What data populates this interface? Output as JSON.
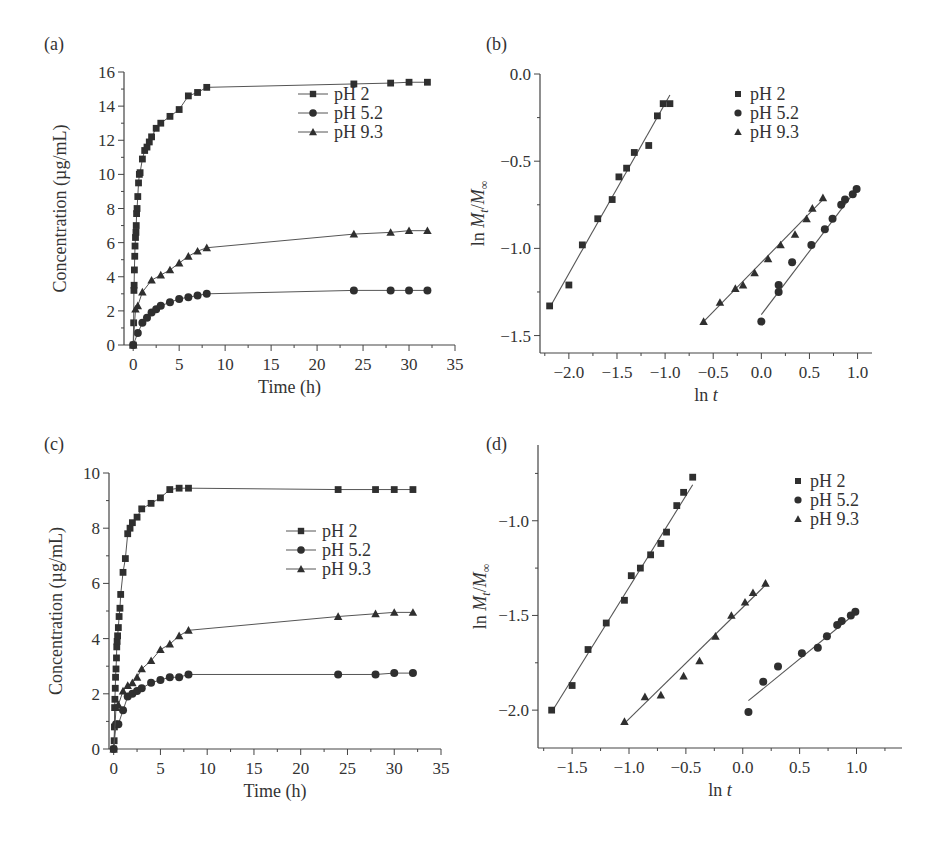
{
  "chart_data": [
    {
      "id": "a",
      "panel_label": "(a)",
      "type": "line",
      "xlabel": "Time (h)",
      "ylabel": "Concentration (µg/mL)",
      "xlim": [
        -1,
        35
      ],
      "ylim": [
        0,
        16
      ],
      "xticks": [
        0,
        5,
        10,
        15,
        20,
        25,
        30,
        35
      ],
      "yticks": [
        0,
        2,
        4,
        6,
        8,
        10,
        12,
        14,
        16
      ],
      "ytick_decimals": 0,
      "xtick_decimals": 0,
      "legend": "center-right",
      "legend_style": "line-marker",
      "series": [
        {
          "name": "pH 2",
          "marker": "square",
          "x": [
            0,
            0.05,
            0.08,
            0.1,
            0.13,
            0.17,
            0.2,
            0.25,
            0.3,
            0.33,
            0.37,
            0.42,
            0.5,
            0.58,
            0.67,
            0.75,
            1,
            1.25,
            1.5,
            1.75,
            2,
            2.5,
            3,
            4,
            5,
            6,
            7,
            8,
            24,
            28,
            30,
            32
          ],
          "y": [
            0,
            1.3,
            3.2,
            3.5,
            4.4,
            5.2,
            5.8,
            6.3,
            6.6,
            7.0,
            7.7,
            8.0,
            8.7,
            9.5,
            10.0,
            10.1,
            10.9,
            11.4,
            11.6,
            11.9,
            12.2,
            12.7,
            13.0,
            13.4,
            13.8,
            14.6,
            14.8,
            15.1,
            15.3,
            15.35,
            15.4,
            15.4
          ],
          "note": "pH 2 curve"
        },
        {
          "name": "pH 5.2",
          "marker": "circle",
          "x": [
            0,
            0.5,
            1,
            1.5,
            2,
            2.5,
            3,
            4,
            5,
            6,
            7,
            8,
            24,
            28,
            30,
            32
          ],
          "y": [
            0,
            0.7,
            1.3,
            1.6,
            1.9,
            2.1,
            2.3,
            2.5,
            2.7,
            2.8,
            2.9,
            3.0,
            3.2,
            3.2,
            3.2,
            3.2
          ]
        },
        {
          "name": "pH 9.3",
          "marker": "triangle",
          "x": [
            0,
            0.25,
            0.5,
            1,
            2,
            3,
            4,
            5,
            6,
            7,
            8,
            24,
            28,
            30,
            32
          ],
          "y": [
            0,
            2.1,
            2.3,
            3.1,
            3.8,
            4.1,
            4.4,
            4.8,
            5.2,
            5.5,
            5.7,
            6.5,
            6.6,
            6.7,
            6.7
          ]
        }
      ]
    },
    {
      "id": "b",
      "panel_label": "(b)",
      "type": "scatter",
      "xlabel": "ln t",
      "ylabel": "ln Mt/M∞",
      "xlim": [
        -2.3,
        1.15
      ],
      "ylim": [
        -1.6,
        0.0
      ],
      "xticks": [
        -2.0,
        -1.5,
        -1.0,
        -0.5,
        0.0,
        0.5,
        1.0
      ],
      "yticks": [
        0.0,
        -0.5,
        -1.0,
        -1.5
      ],
      "ytick_decimals": 1,
      "xtick_decimals": 1,
      "legend": "top-right",
      "legend_style": "marker-only",
      "series": [
        {
          "name": "pH 2",
          "marker": "square",
          "x": [
            -2.2,
            -2.0,
            -1.86,
            -1.7,
            -1.55,
            -1.48,
            -1.4,
            -1.32,
            -1.17,
            -1.08,
            -1.02,
            -0.95
          ],
          "y": [
            -1.33,
            -1.21,
            -0.98,
            -0.83,
            -0.72,
            -0.59,
            -0.54,
            -0.45,
            -0.41,
            -0.24,
            -0.17,
            -0.17
          ],
          "fit": {
            "x": [
              -2.2,
              -0.95
            ],
            "y": [
              -1.34,
              -0.12
            ]
          }
        },
        {
          "name": "pH 5.2",
          "marker": "circle",
          "x": [
            0.0,
            0.18,
            0.18,
            0.32,
            0.52,
            0.66,
            0.74,
            0.83,
            0.87,
            0.95,
            0.99
          ],
          "y": [
            -1.42,
            -1.25,
            -1.21,
            -1.08,
            -0.98,
            -0.89,
            -0.83,
            -0.75,
            -0.72,
            -0.69,
            -0.66
          ],
          "fit": {
            "x": [
              0.0,
              0.99
            ],
            "y": [
              -1.38,
              -0.66
            ]
          }
        },
        {
          "name": "pH 9.3",
          "marker": "triangle",
          "x": [
            -0.6,
            -0.43,
            -0.27,
            -0.19,
            -0.07,
            0.07,
            0.2,
            0.35,
            0.47,
            0.53,
            0.64
          ],
          "y": [
            -1.42,
            -1.31,
            -1.23,
            -1.21,
            -1.14,
            -1.06,
            -0.98,
            -0.92,
            -0.83,
            -0.77,
            -0.71
          ],
          "fit": {
            "x": [
              -0.6,
              0.64
            ],
            "y": [
              -1.42,
              -0.72
            ]
          }
        }
      ]
    },
    {
      "id": "c",
      "panel_label": "(c)",
      "type": "line",
      "xlabel": "Time (h)",
      "ylabel": "Concentration (µg/mL)",
      "xlim": [
        -0.5,
        35
      ],
      "ylim": [
        0,
        10
      ],
      "xticks": [
        0,
        5,
        10,
        15,
        20,
        25,
        30,
        35
      ],
      "yticks": [
        0,
        2,
        4,
        6,
        8,
        10
      ],
      "ytick_decimals": 0,
      "xtick_decimals": 0,
      "legend": "center-right",
      "legend_style": "line-marker",
      "series": [
        {
          "name": "pH 2",
          "marker": "square",
          "x": [
            0,
            0.05,
            0.08,
            0.1,
            0.13,
            0.17,
            0.2,
            0.25,
            0.3,
            0.33,
            0.37,
            0.42,
            0.5,
            0.58,
            0.67,
            0.75,
            1,
            1.25,
            1.5,
            1.75,
            2,
            2.5,
            3,
            4,
            5,
            6,
            7,
            8,
            24,
            28,
            30,
            32
          ],
          "y": [
            0,
            0.3,
            0.8,
            1.5,
            1.8,
            2.2,
            2.6,
            2.9,
            3.3,
            3.7,
            3.9,
            4.1,
            4.4,
            4.8,
            5.1,
            5.6,
            6.4,
            6.9,
            7.8,
            8.0,
            8.2,
            8.4,
            8.7,
            8.9,
            9.1,
            9.4,
            9.45,
            9.45,
            9.4,
            9.4,
            9.4,
            9.4
          ]
        },
        {
          "name": "pH 5.2",
          "marker": "circle",
          "x": [
            0,
            0.25,
            0.5,
            1,
            1.5,
            2,
            2.5,
            3,
            4,
            5,
            6,
            7,
            8,
            24,
            28,
            30,
            32
          ],
          "y": [
            0,
            0.9,
            0.9,
            1.4,
            1.9,
            2.0,
            2.1,
            2.2,
            2.4,
            2.5,
            2.6,
            2.6,
            2.7,
            2.7,
            2.7,
            2.75,
            2.75
          ]
        },
        {
          "name": "pH 9.3",
          "marker": "triangle",
          "x": [
            0,
            0.25,
            0.5,
            1,
            1.5,
            2,
            2.5,
            3,
            4,
            5,
            6,
            7,
            8,
            24,
            28,
            30,
            32
          ],
          "y": [
            0,
            1.5,
            1.6,
            2.1,
            2.3,
            2.4,
            2.6,
            2.9,
            3.2,
            3.6,
            3.8,
            4.1,
            4.3,
            4.8,
            4.9,
            4.95,
            4.95
          ]
        }
      ]
    },
    {
      "id": "d",
      "panel_label": "(d)",
      "type": "scatter",
      "xlabel": "ln t",
      "ylabel": "ln Mt/M∞",
      "xlim": [
        -1.8,
        1.4
      ],
      "ylim": [
        -2.2,
        -0.6
      ],
      "xticks": [
        -1.5,
        -1.0,
        -0.5,
        0.0,
        0.5,
        1.0
      ],
      "yticks": [
        -1.0,
        -1.5,
        -2.0
      ],
      "ytick_decimals": 1,
      "xtick_decimals": 1,
      "legend": "top-right",
      "legend_style": "marker-only",
      "series": [
        {
          "name": "pH 2",
          "marker": "square",
          "x": [
            -1.68,
            -1.5,
            -1.36,
            -1.2,
            -1.04,
            -0.98,
            -0.9,
            -0.81,
            -0.72,
            -0.67,
            -0.58,
            -0.52,
            -0.44
          ],
          "y": [
            -2.0,
            -1.87,
            -1.68,
            -1.54,
            -1.42,
            -1.29,
            -1.25,
            -1.18,
            -1.12,
            -1.06,
            -0.92,
            -0.85,
            -0.77
          ],
          "fit": {
            "x": [
              -1.68,
              -0.44
            ],
            "y": [
              -2.01,
              -0.81
            ]
          }
        },
        {
          "name": "pH 5.2",
          "marker": "circle",
          "x": [
            0.05,
            0.18,
            0.31,
            0.52,
            0.66,
            0.74,
            0.83,
            0.87,
            0.95,
            0.99
          ],
          "y": [
            -2.01,
            -1.85,
            -1.77,
            -1.7,
            -1.67,
            -1.61,
            -1.55,
            -1.53,
            -1.5,
            -1.48
          ],
          "fit": {
            "x": [
              0.05,
              0.99
            ],
            "y": [
              -1.95,
              -1.49
            ]
          }
        },
        {
          "name": "pH 9.3",
          "marker": "triangle",
          "x": [
            -1.04,
            -0.86,
            -0.72,
            -0.52,
            -0.38,
            -0.24,
            -0.1,
            0.02,
            0.09,
            0.2
          ],
          "y": [
            -2.06,
            -1.93,
            -1.92,
            -1.82,
            -1.74,
            -1.61,
            -1.5,
            -1.43,
            -1.38,
            -1.33
          ],
          "fit": {
            "x": [
              -1.04,
              0.2
            ],
            "y": [
              -2.07,
              -1.34
            ]
          }
        }
      ]
    }
  ]
}
